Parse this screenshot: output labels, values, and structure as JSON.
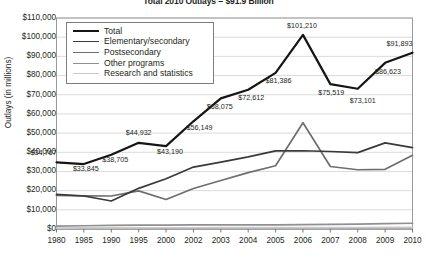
{
  "chart_data": {
    "type": "line",
    "title": "Total 2010 Outlays = $91.9 Billion",
    "xlabel": "",
    "ylabel": "Outlays (in millions)",
    "categories": [
      "1980",
      "1985",
      "1990",
      "1995",
      "2000",
      "2002",
      "2003",
      "2004",
      "2005",
      "2006",
      "2007",
      "2008",
      "2009",
      "2010"
    ],
    "ylim": [
      0,
      110000
    ],
    "ytick_step": 10000,
    "ytick_labels": [
      "$110,000",
      "$100,000",
      "$90,000",
      "$80,000",
      "$70,000",
      "$60,000",
      "$50,000",
      "$40,000",
      "$30,000",
      "$20,000",
      "$10,000",
      "$0"
    ],
    "ytick_values": [
      110000,
      100000,
      90000,
      80000,
      70000,
      60000,
      50000,
      40000,
      30000,
      20000,
      10000,
      0
    ],
    "grid": true,
    "legend_position": "upper-left",
    "series": [
      {
        "name": "Total",
        "color": "#151515",
        "width": 2.2,
        "values": [
          34767,
          33845,
          38705,
          44932,
          43190,
          56149,
          68075,
          72612,
          81386,
          101210,
          75519,
          73101,
          86623,
          91893
        ],
        "point_labels": [
          "$34,767",
          "$33,845",
          "$38,705",
          "$44,932",
          "$43,190",
          "$56,149",
          "$68,075",
          "$72,612",
          "$81,386",
          "$101,210",
          "$75,519",
          "$73,101",
          "$86,623",
          "$91,893"
        ]
      },
      {
        "name": "Elementary/secondary",
        "color": "#3a3a3a",
        "width": 1.7,
        "values": [
          18000,
          17200,
          14600,
          21200,
          26200,
          32300,
          34900,
          37600,
          40700,
          40800,
          40400,
          39800,
          44900,
          42400
        ]
      },
      {
        "name": "Postsecondary",
        "color": "#6e6e6e",
        "width": 1.7,
        "values": [
          17500,
          17300,
          17200,
          19900,
          15400,
          21100,
          25300,
          29400,
          33000,
          55400,
          32600,
          30900,
          31100,
          38400
        ]
      },
      {
        "name": "Other programs",
        "color": "#8f8f8f",
        "width": 1.7,
        "values": [
          1500,
          1700,
          1900,
          2000,
          2000,
          2100,
          2200,
          2200,
          2200,
          2300,
          2400,
          2500,
          2800,
          3000
        ]
      },
      {
        "name": "Research and statistics",
        "color": "#c9c9c9",
        "width": 1.7,
        "values": [
          500,
          550,
          600,
          620,
          640,
          660,
          680,
          700,
          720,
          740,
          760,
          780,
          800,
          820
        ]
      }
    ],
    "point_label_offsets": [
      {
        "dx": -26,
        "dy": -9
      },
      {
        "dx": -11,
        "dy": 5
      },
      {
        "dx": -9,
        "dy": 5
      },
      {
        "dx": -13,
        "dy": -10
      },
      {
        "dx": -9,
        "dy": 6
      },
      {
        "dx": -7,
        "dy": 7
      },
      {
        "dx": -14,
        "dy": 9
      },
      {
        "dx": -10,
        "dy": 8
      },
      {
        "dx": -10,
        "dy": 8
      },
      {
        "dx": -16,
        "dy": -9
      },
      {
        "dx": -12,
        "dy": 9
      },
      {
        "dx": -8,
        "dy": 12
      },
      {
        "dx": -10,
        "dy": 9
      },
      {
        "dx": -26,
        "dy": -9
      }
    ]
  },
  "legend": {
    "items": [
      {
        "label": "Total"
      },
      {
        "label": "Elementary/secondary"
      },
      {
        "label": "Postsecondary"
      },
      {
        "label": "Other programs"
      },
      {
        "label": "Research and statistics"
      }
    ]
  }
}
